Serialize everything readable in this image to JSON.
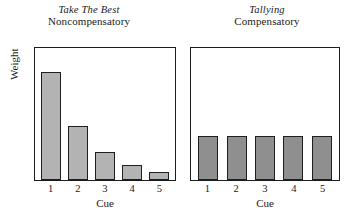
{
  "chart_data": [
    {
      "type": "bar",
      "title": "Take The Best",
      "subtitle": "Noncompensatory",
      "categories": [
        "1",
        "2",
        "3",
        "4",
        "5"
      ],
      "values": [
        0.82,
        0.41,
        0.21,
        0.11,
        0.06
      ],
      "xlabel": "Cue",
      "ylabel": "Weight",
      "ylim": [
        0,
        1
      ],
      "grid": false,
      "legend": "none",
      "bar_fill": "#b3b3b3",
      "bar_stroke": "#1f1f1f"
    },
    {
      "type": "bar",
      "title": "Tallying",
      "subtitle": "Compensatory",
      "categories": [
        "1",
        "2",
        "3",
        "4",
        "5"
      ],
      "values": [
        0.33,
        0.33,
        0.33,
        0.33,
        0.33
      ],
      "xlabel": "Cue",
      "ylabel": "",
      "ylim": [
        0,
        1
      ],
      "grid": false,
      "legend": "none",
      "bar_fill": "#8f8f8f",
      "bar_stroke": "#1f1f1f"
    }
  ]
}
